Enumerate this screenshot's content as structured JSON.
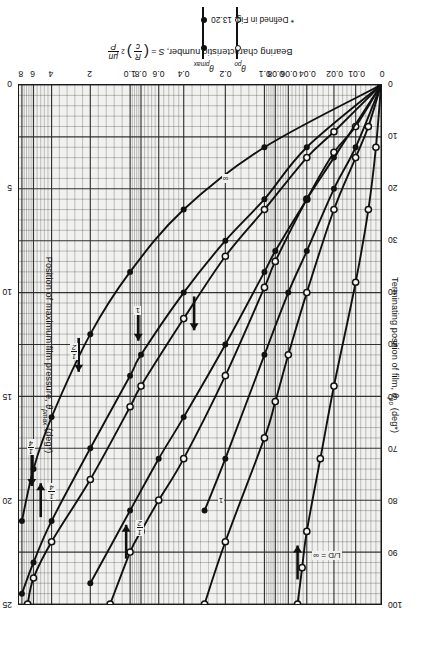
{
  "figure": {
    "rotation_note": "source scan is printed upside-down (180 degrees)",
    "background_color": "#ffffff",
    "plot_fill_color": "#f1f1ef",
    "ink_color": "#111111"
  },
  "axes": {
    "x": {
      "label_prefix": "Bearing characteristic number,",
      "label_symbol": "S",
      "label_equals": "=",
      "label_frac1_num": "R",
      "label_frac1_den": "c",
      "label_exp": "2",
      "label_frac2_num": "μn",
      "label_frac2_den": "P",
      "full_label": "Bearing characteristic number, S = (R/c)² μn/P",
      "scale": "log-like compressed engineering scale",
      "ticks": [
        "0",
        "0.01",
        "0.02",
        "0.04",
        "0.06",
        "0.08",
        "0.1",
        "0.2",
        "0.4",
        "0.6",
        "0.8",
        "1.0",
        "2",
        "4",
        "6",
        "8"
      ],
      "tick_positions_pct": [
        0,
        7.0,
        13.0,
        20.5,
        25.6,
        29.2,
        32.2,
        43.0,
        54.5,
        61.4,
        66.3,
        69.3,
        80.3,
        91.0,
        96.0,
        99.2
      ]
    },
    "y_left": {
      "label_prefix": "Terminating position of film,",
      "label_symbol": "θ",
      "label_sub": "po",
      "label_unit": "(deg*)",
      "full_label": "Terminating position of film, θpo (deg*)",
      "ticks": [
        "0",
        "10",
        "20",
        "30",
        "40",
        "50",
        "60",
        "70",
        "80",
        "90",
        "100"
      ],
      "range": [
        0,
        100
      ]
    },
    "y_right": {
      "label_prefix": "Position of maximum film pressure,",
      "label_symbol": "θ",
      "label_sub": "pmax",
      "label_unit": "(deg*)",
      "full_label": "Position of maximum film pressure, θpmax (deg*)",
      "ticks": [
        "0",
        "5",
        "10",
        "15",
        "20",
        "25"
      ],
      "range": [
        0,
        25
      ]
    }
  },
  "annotations": {
    "ld_infinity": "L/D = ∞",
    "label_quarter": {
      "num": "1",
      "den": "4"
    },
    "label_half": {
      "num": "1",
      "den": "2"
    },
    "label_one": "1",
    "label_infinity": "∞"
  },
  "legend": {
    "series": [
      {
        "name": "theta-po",
        "symbol_label": "θ",
        "sub": "po",
        "marker": "open-circle"
      },
      {
        "name": "theta-pmax",
        "symbol_label": "θ",
        "sub": "pmax",
        "marker": "filled-circle"
      }
    ],
    "footnote": "* Defined in Fig. 13.20"
  },
  "chart_data": {
    "type": "line",
    "title": "",
    "xlabel": "Bearing characteristic number, S = (R/c)² μn/P",
    "ylabel": "Terminating position of film, θpo (deg*)",
    "y2label": "Position of maximum film pressure, θpmax (deg*)",
    "xlim": [
      0,
      8
    ],
    "ylim": [
      0,
      100
    ],
    "y2lim": [
      0,
      25
    ],
    "xticks": [
      0,
      0.01,
      0.02,
      0.04,
      0.06,
      0.08,
      0.1,
      0.2,
      0.4,
      0.6,
      0.8,
      1.0,
      2,
      4,
      6,
      8
    ],
    "yticks": [
      0,
      10,
      20,
      30,
      40,
      50,
      60,
      70,
      80,
      90,
      100
    ],
    "y2ticks": [
      0,
      5,
      10,
      15,
      20,
      25
    ],
    "grid": true,
    "legend_position": "below-axes",
    "series": [
      {
        "name": "θpo, L/D = ∞",
        "axis": "left",
        "marker": "open-circle",
        "label": "L/D = ∞",
        "x": [
          0.0,
          0.002,
          0.005,
          0.01,
          0.02,
          0.03,
          0.04,
          0.045,
          0.05
        ],
        "y": [
          0.0,
          12.0,
          24.0,
          38.0,
          58.0,
          72.0,
          86.0,
          93.0,
          100.0
        ]
      },
      {
        "name": "θpo, L/D = 1",
        "axis": "left",
        "marker": "open-circle",
        "label": "1",
        "x": [
          0.0,
          0.005,
          0.01,
          0.02,
          0.04,
          0.06,
          0.08,
          0.1,
          0.2,
          0.3
        ],
        "y": [
          0.0,
          8.0,
          14.0,
          24.0,
          40.0,
          52.0,
          61.0,
          68.0,
          88.0,
          100.0
        ]
      },
      {
        "name": "θpo, L/D = 1/2",
        "axis": "left",
        "marker": "open-circle",
        "label": "1/2",
        "x": [
          0.0,
          0.01,
          0.02,
          0.04,
          0.08,
          0.1,
          0.2,
          0.4,
          0.6,
          0.8,
          1.0,
          1.5
        ],
        "y": [
          0.0,
          8.0,
          13.0,
          22.0,
          34.0,
          39.0,
          56.0,
          72.0,
          80.0,
          86.0,
          90.0,
          100.0
        ]
      },
      {
        "name": "θpo, L/D = 1/4",
        "axis": "left",
        "marker": "open-circle",
        "label": "1/4",
        "x": [
          0.0,
          0.02,
          0.04,
          0.1,
          0.2,
          0.4,
          0.8,
          1.0,
          2.0,
          4.0,
          6.0,
          7.0
        ],
        "y": [
          0.0,
          9.0,
          14.0,
          24.0,
          33.0,
          45.0,
          58.0,
          62.0,
          76.0,
          88.0,
          95.0,
          100.0
        ]
      },
      {
        "name": "θpmax, L/D = ∞",
        "axis": "right",
        "marker": "filled-circle",
        "label": "∞",
        "x": [
          0.0,
          0.01,
          0.02,
          0.04,
          0.06,
          0.1,
          0.2,
          0.3
        ],
        "y": [
          0.0,
          3.0,
          5.0,
          8.0,
          10.0,
          13.0,
          18.0,
          20.5
        ]
      },
      {
        "name": "θpmax, L/D = 1",
        "axis": "right",
        "marker": "filled-circle",
        "label": "1",
        "x": [
          0.0,
          0.02,
          0.04,
          0.08,
          0.1,
          0.2,
          0.4,
          0.6,
          1.0,
          2.0
        ],
        "y": [
          0.0,
          3.5,
          5.5,
          8.0,
          9.0,
          12.5,
          16.0,
          18.0,
          20.5,
          24.0
        ]
      },
      {
        "name": "θpmax, L/D = 1/2",
        "axis": "right",
        "marker": "filled-circle",
        "label": "1/2",
        "x": [
          0.0,
          0.04,
          0.1,
          0.2,
          0.4,
          0.8,
          1.0,
          2.0,
          4.0,
          6.0,
          8.0
        ],
        "y": [
          0.0,
          3.0,
          5.5,
          7.5,
          10.0,
          13.0,
          14.0,
          17.5,
          21.0,
          23.0,
          24.5
        ]
      },
      {
        "name": "θpmax, L/D = 1/4",
        "axis": "right",
        "marker": "filled-circle",
        "label": "1/4",
        "x": [
          0.0,
          0.1,
          0.4,
          1.0,
          2.0,
          4.0,
          6.0,
          8.0
        ],
        "y": [
          0.0,
          3.0,
          6.0,
          9.0,
          12.0,
          16.0,
          18.5,
          21.0
        ]
      }
    ]
  }
}
